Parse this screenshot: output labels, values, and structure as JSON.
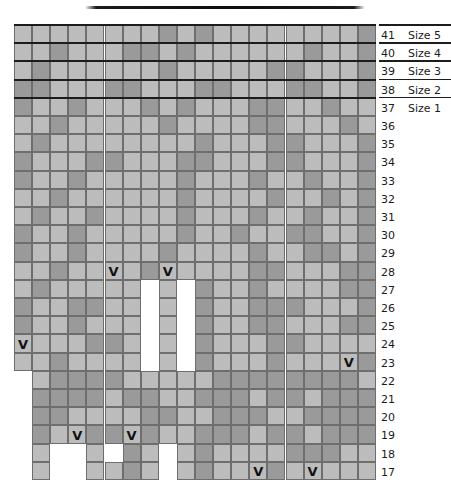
{
  "chart_data": {
    "type": "heatmap",
    "title": "",
    "colors": {
      "light": "#bcbcbc",
      "dark": "#9a9a9a",
      "empty": "#ffffff",
      "grid_line": "#6e6e6e",
      "rule": "#1c1c1c"
    },
    "legend": [
      {
        "key": "light",
        "label": "main colour"
      },
      {
        "key": "dark",
        "label": "contrast colour"
      },
      {
        "key": "V",
        "label": "decrease"
      }
    ],
    "columns": 20,
    "row_numbers": [
      41,
      40,
      39,
      38,
      37,
      36,
      35,
      34,
      33,
      32,
      31,
      30,
      29,
      28,
      27,
      26,
      25,
      24,
      23,
      22,
      21,
      20,
      19,
      18,
      17
    ],
    "size_labels": [
      {
        "row": 41,
        "label": "Size 5"
      },
      {
        "row": 40,
        "label": "Size 4"
      },
      {
        "row": 39,
        "label": "Size 3"
      },
      {
        "row": 38,
        "label": "Size 2"
      },
      {
        "row": 37,
        "label": "Size 1"
      }
    ],
    "grid": [
      {
        "row": 41,
        "start": 0,
        "cells": "lllllllldldlllllllld"
      },
      {
        "row": 40,
        "start": 0,
        "cells": "lldlllddldlllllldlld"
      },
      {
        "row": 39,
        "start": 0,
        "cells": "ldlllllldlllllddllld"
      },
      {
        "row": 38,
        "start": 0,
        "cells": "ddlllddlllddlllddlld"
      },
      {
        "row": 37,
        "start": 0,
        "cells": "dlldllldldlllddlldll"
      },
      {
        "row": 36,
        "start": 0,
        "cells": "lldllllldllllddllldl"
      },
      {
        "row": 35,
        "start": 0,
        "cells": "ldlllllllldlllddllld"
      },
      {
        "row": 34,
        "start": 0,
        "cells": "dlllddlllddlllddllld"
      },
      {
        "row": 33,
        "start": 0,
        "cells": "dlldllllldllldlldlld"
      },
      {
        "row": 32,
        "start": 0,
        "cells": "lldlllllldlllldlldld"
      },
      {
        "row": 31,
        "start": 0,
        "cells": "ldlldlllldllldlldlld"
      },
      {
        "row": 30,
        "start": 0,
        "cells": "dlldllllldlldllddlld"
      },
      {
        "row": 29,
        "start": 0,
        "cells": "dlldlllldlllldllddld"
      },
      {
        "row": 28,
        "start": 0,
        "cells": "lldllVldVllllddllldd"
      },
      {
        "row": 27,
        "start": 0,
        "cells": "ldllllldlldlldlllldd"
      },
      {
        "row": 26,
        "start": 0,
        "cells": "dllddlldlldlldddllld"
      },
      {
        "row": 25,
        "start": 0,
        "cells": "dlldllldlldllddllldd"
      },
      {
        "row": 24,
        "start": 0,
        "cells": "Vlllddldlldlllddllll"
      },
      {
        "row": 23,
        "start": 0,
        "cells": "lldlllldlldllldlllVd"
      },
      {
        "row": 22,
        "start": 1,
        "cells": "lddddlllllddddddddl"
      },
      {
        "row": 21,
        "start": 1,
        "cells": "ddddlddlldddlddlddd"
      },
      {
        "row": 20,
        "start": 1,
        "cells": "ddllllddlldddlldddd"
      },
      {
        "row": 19,
        "start": 1,
        "cells": "dlVddVdlldddlddlddd"
      },
      {
        "row": 18,
        "start": 1,
        "cells": "l..l.dl.ldlllldddll"
      },
      {
        "row": 17,
        "start": 1,
        "cells": "l..lldl.ldllVdlVlll"
      }
    ],
    "gaps": {
      "description": "white vertical channels that split the hand into fingers below row 28",
      "thumb_gap_columns": [
        7,
        9
      ],
      "thumb_gap_rows": [
        27,
        26,
        25,
        24,
        23
      ],
      "finger_gap_columns_18_17": [
        2,
        3,
        8
      ],
      "left_step_rows": {
        "22": 1,
        "23": 0
      }
    },
    "decreases": [
      {
        "row": 28,
        "col": 5
      },
      {
        "row": 28,
        "col": 8
      },
      {
        "row": 24,
        "col": 0
      },
      {
        "row": 23,
        "col": 18
      },
      {
        "row": 19,
        "col": 3
      },
      {
        "row": 19,
        "col": 6
      },
      {
        "row": 17,
        "col": 13
      },
      {
        "row": 17,
        "col": 16
      }
    ]
  }
}
